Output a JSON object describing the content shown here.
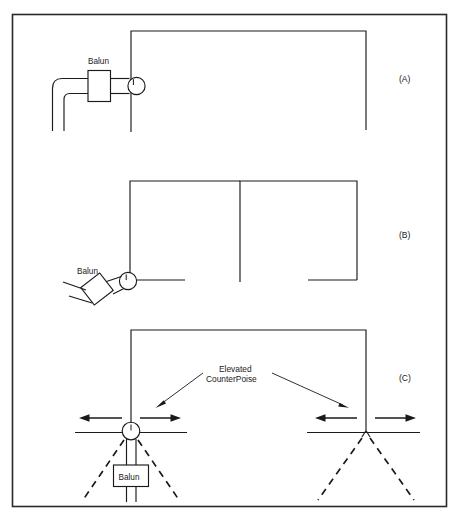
{
  "figure": {
    "border_color": "#2a2a2a",
    "line_color": "#1a1a1a",
    "background": "#ffffff"
  },
  "panels": [
    {
      "id": "A",
      "label": "(A)",
      "balun_label": "Balun",
      "description": "Inverted-U / loop element fed at left vertical leg through a balun and coax feedline"
    },
    {
      "id": "B",
      "label": "(B)",
      "balun_label": "Balun",
      "description": "Inverted-U element fed at lower left corner through an angled balun and open-wire line"
    },
    {
      "id": "C",
      "label": "(C)",
      "balun_label": "Balun",
      "description": "Inverted-U element with elevated counterpoise wires at both lower ends, balun in feedline"
    }
  ],
  "annotations": {
    "counterpoise_line1": "Elevated",
    "counterpoise_line2": "CounterPoise"
  }
}
